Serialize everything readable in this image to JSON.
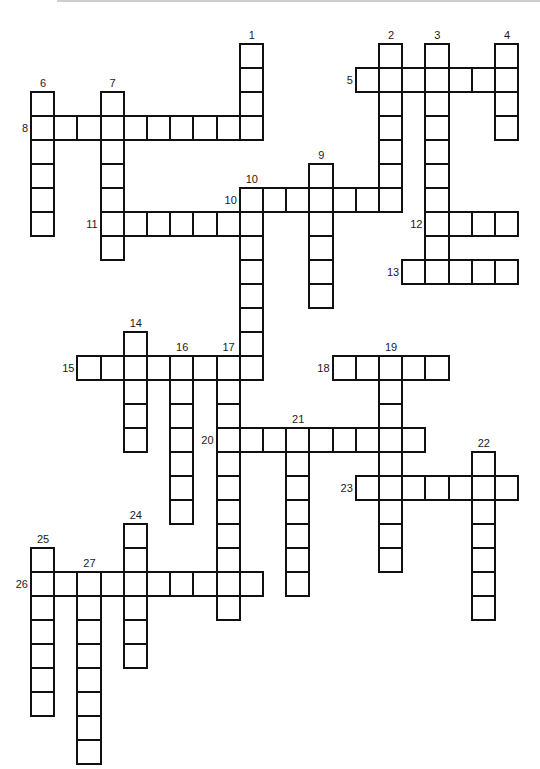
{
  "puzzle": {
    "type": "crossword",
    "grid": {
      "origin_x": 31,
      "origin_y": 43.7,
      "cell_w": 23.2,
      "cell_h": 24
    },
    "words": [
      {
        "number": "1",
        "dir": "down",
        "col": 9,
        "row": 0,
        "length": 4
      },
      {
        "number": "2",
        "dir": "down",
        "col": 15,
        "row": 0,
        "length": 7
      },
      {
        "number": "3",
        "dir": "down",
        "col": 17,
        "row": 0,
        "length": 10
      },
      {
        "number": "4",
        "dir": "down",
        "col": 20,
        "row": 0,
        "length": 4
      },
      {
        "number": "5",
        "dir": "across",
        "col": 14,
        "row": 1,
        "length": 7
      },
      {
        "number": "6",
        "dir": "down",
        "col": 0,
        "row": 2,
        "length": 6
      },
      {
        "number": "7",
        "dir": "down",
        "col": 3,
        "row": 2,
        "length": 7
      },
      {
        "number": "8",
        "dir": "across",
        "col": 0,
        "row": 3,
        "length": 10
      },
      {
        "number": "9",
        "dir": "down",
        "col": 12,
        "row": 5,
        "length": 6
      },
      {
        "number": "10",
        "dir": "across",
        "col": 9,
        "row": 6,
        "length": 7
      },
      {
        "number": "10",
        "dir": "down",
        "col": 9,
        "row": 6,
        "length": 8
      },
      {
        "number": "11",
        "dir": "across",
        "col": 3,
        "row": 7,
        "length": 7
      },
      {
        "number": "12",
        "dir": "across",
        "col": 17,
        "row": 7,
        "length": 4
      },
      {
        "number": "13",
        "dir": "across",
        "col": 16,
        "row": 9,
        "length": 5
      },
      {
        "number": "14",
        "dir": "down",
        "col": 4,
        "row": 12,
        "length": 5
      },
      {
        "number": "15",
        "dir": "across",
        "col": 2,
        "row": 13,
        "length": 8
      },
      {
        "number": "16",
        "dir": "down",
        "col": 6,
        "row": 13,
        "length": 7
      },
      {
        "number": "17",
        "dir": "down",
        "col": 8,
        "row": 13,
        "length": 11
      },
      {
        "number": "18",
        "dir": "across",
        "col": 13,
        "row": 13,
        "length": 5
      },
      {
        "number": "19",
        "dir": "down",
        "col": 15,
        "row": 13,
        "length": 9
      },
      {
        "number": "20",
        "dir": "across",
        "col": 8,
        "row": 16,
        "length": 9
      },
      {
        "number": "21",
        "dir": "down",
        "col": 11,
        "row": 16,
        "length": 7
      },
      {
        "number": "22",
        "dir": "down",
        "col": 19,
        "row": 17,
        "length": 7
      },
      {
        "number": "23",
        "dir": "across",
        "col": 14,
        "row": 18,
        "length": 7
      },
      {
        "number": "24",
        "dir": "down",
        "col": 4,
        "row": 20,
        "length": 6
      },
      {
        "number": "25",
        "dir": "down",
        "col": 0,
        "row": 21,
        "length": 7
      },
      {
        "number": "26",
        "dir": "across",
        "col": 0,
        "row": 22,
        "length": 10
      },
      {
        "number": "27",
        "dir": "down",
        "col": 2,
        "row": 22,
        "length": 8
      }
    ]
  }
}
